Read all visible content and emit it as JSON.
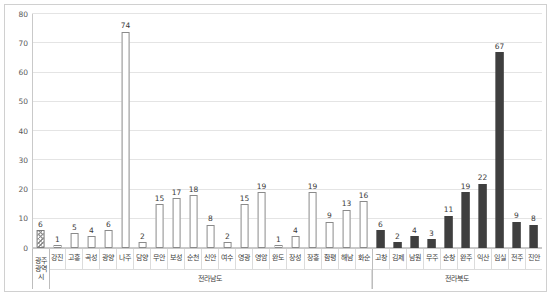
{
  "chart_data": {
    "type": "bar",
    "title": "",
    "subtitle": "",
    "xlabel": "",
    "ylabel": "",
    "ylim": [
      0,
      80
    ],
    "y_ticks": [
      0,
      10,
      20,
      30,
      40,
      50,
      60,
      70,
      80
    ],
    "grid": true,
    "legend": "none",
    "categories": [
      "광주\n광역시",
      "강진",
      "고흥",
      "곡성",
      "광양",
      "나주",
      "담양",
      "무안",
      "보성",
      "순천",
      "신안",
      "여수",
      "영광",
      "영암",
      "완도",
      "장성",
      "장흥",
      "함평",
      "해남",
      "화순",
      "고창",
      "김제",
      "남원",
      "무주",
      "순창",
      "완주",
      "익산",
      "임실",
      "전주",
      "진안"
    ],
    "values": [
      6,
      1,
      5,
      4,
      6,
      74,
      2,
      15,
      17,
      18,
      8,
      2,
      15,
      19,
      1,
      4,
      19,
      9,
      13,
      16,
      6,
      2,
      4,
      3,
      11,
      19,
      22,
      67,
      9,
      8
    ],
    "bar_styles": [
      "hatched",
      "outline",
      "outline",
      "outline",
      "outline",
      "outline",
      "outline",
      "outline",
      "outline",
      "outline",
      "outline",
      "outline",
      "outline",
      "outline",
      "outline",
      "outline",
      "outline",
      "outline",
      "outline",
      "outline",
      "filled",
      "filled",
      "filled",
      "filled",
      "filled",
      "filled",
      "filled",
      "filled",
      "filled",
      "filled"
    ],
    "groups": [
      {
        "label": "광주\n광역시",
        "count": 1
      },
      {
        "label": "전라남도",
        "count": 19
      },
      {
        "label": "전라북도",
        "count": 10
      }
    ],
    "colors": {
      "outline_stroke": "#8a8a8a",
      "filled_fill": "#3f3f3f",
      "hatch_stroke": "#8d8d8d",
      "gridline": "#e4e4e4",
      "axis": "#c9c9c9",
      "text": "#3a3a3a",
      "tick_text": "#5a5a5a",
      "background": "#ffffff"
    }
  }
}
